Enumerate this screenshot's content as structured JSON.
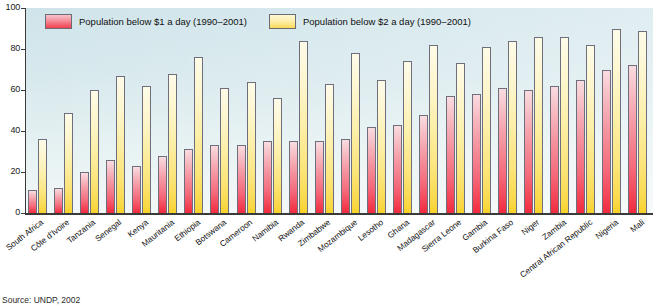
{
  "chart_data": {
    "type": "bar",
    "title": "",
    "subtitle": "",
    "xlabel": "",
    "ylabel": "",
    "ylim": [
      0,
      100
    ],
    "yticks": [
      0,
      20,
      40,
      60,
      80,
      100
    ],
    "grid": false,
    "legend_position": "top-left",
    "categories": [
      "South Africa",
      "Côte d'Ivoire",
      "Tanzania",
      "Senegal",
      "Kenya",
      "Mauritania",
      "Ethiopia",
      "Botswana",
      "Cameroon",
      "Namibia",
      "Rwanda",
      "Zimbabwe",
      "Mozambique",
      "Lesotho",
      "Ghana",
      "Madagascar",
      "Sierra Leone",
      "Gambia",
      "Burkina Faso",
      "Niger",
      "Zambia",
      "Central African Republic",
      "Nigeria",
      "Mali"
    ],
    "series": [
      {
        "name": "Population below $1 a day (1990–2001)",
        "color": "#f4616f",
        "values": [
          11,
          12,
          20,
          26,
          23,
          28,
          31,
          33,
          33,
          35,
          35,
          35,
          36,
          42,
          43,
          48,
          57,
          58,
          61,
          60,
          62,
          65,
          70,
          72
        ]
      },
      {
        "name": "Population below $2 a day (1990–2001)",
        "color": "#fbe27a",
        "values": [
          36,
          49,
          60,
          67,
          62,
          68,
          76,
          61,
          64,
          56,
          84,
          63,
          78,
          65,
          74,
          82,
          73,
          81,
          84,
          86,
          86,
          82,
          90,
          89
        ]
      }
    ]
  },
  "legend": {
    "items": [
      {
        "label": "Population below $1 a day (1990–2001)",
        "swatch": "red"
      },
      {
        "label": "Population below $2 a day (1990–2001)",
        "swatch": "yellow"
      }
    ]
  },
  "axis": {
    "y_tick_labels": [
      "100",
      "80",
      "60",
      "40",
      "20",
      "0"
    ]
  },
  "footer": {
    "source": "Source: UNDP, 2002"
  },
  "colors": {
    "background": "#d8e9ed",
    "bar_red": "#f4616f",
    "bar_yellow": "#fbe27a",
    "axis": "#3a3a3a",
    "bar_outline": "#6e6e7c"
  }
}
